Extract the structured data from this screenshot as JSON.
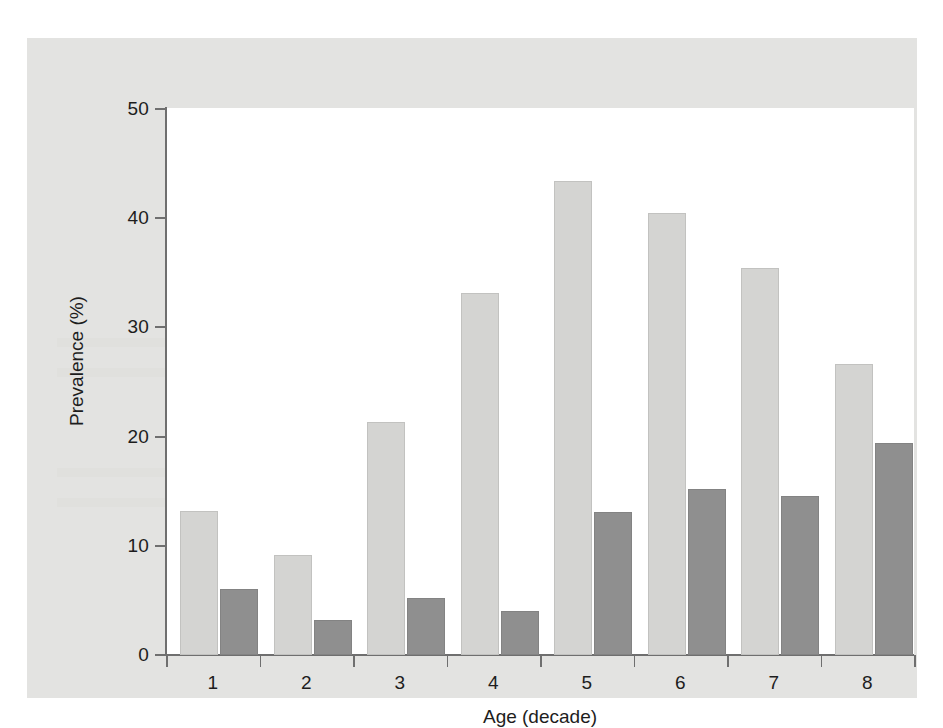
{
  "chart_data": {
    "type": "bar",
    "title": "",
    "subtitle": "",
    "xlabel": "Age (decade)",
    "ylabel": "Prevalence (%)",
    "categories": [
      "1",
      "2",
      "3",
      "4",
      "5",
      "6",
      "7",
      "8"
    ],
    "ylim": [
      0,
      50
    ],
    "yticks": [
      0,
      10,
      20,
      30,
      40,
      50
    ],
    "ytick_labels": [
      "0",
      "10",
      "20",
      "30",
      "40",
      "50"
    ],
    "grid": false,
    "legend": null,
    "legend_position": "none",
    "annotations": [],
    "series": [
      {
        "name": "light-series",
        "color": "#d4d4d2",
        "values": [
          13.2,
          9.1,
          21.3,
          33.1,
          43.3,
          40.4,
          35.4,
          26.6
        ]
      },
      {
        "name": "dark-series",
        "color": "#8f8f8f",
        "values": [
          6.0,
          3.2,
          5.2,
          4.0,
          13.1,
          15.2,
          14.5,
          19.4
        ]
      }
    ]
  },
  "figure": {
    "panel_color": "#e3e3e1",
    "plot_background": "#ffffff",
    "axis_color": "#6f6f6f",
    "text_color": "#1d1d1d"
  }
}
